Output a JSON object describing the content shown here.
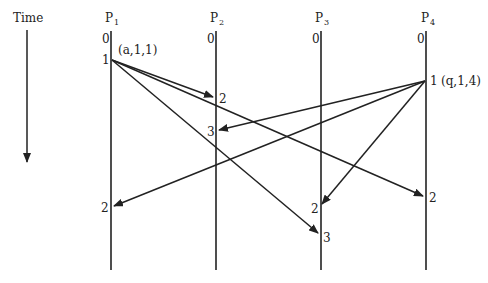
{
  "time_axis": {
    "label": "Time"
  },
  "processes": [
    {
      "name": "P",
      "sub": "1",
      "x": 111,
      "start": "0"
    },
    {
      "name": "P",
      "sub": "2",
      "x": 216,
      "start": "0"
    },
    {
      "name": "P",
      "sub": "3",
      "x": 321,
      "start": "0"
    },
    {
      "name": "P",
      "sub": "4",
      "x": 426,
      "start": "0"
    }
  ],
  "events": [
    {
      "process": "P1",
      "label": "1",
      "annotation": "(a,1,1)"
    },
    {
      "process": "P4",
      "label": "1",
      "annotation": "(q,1,4)"
    },
    {
      "process": "P2",
      "label": "2"
    },
    {
      "process": "P2",
      "label": "3"
    },
    {
      "process": "P1",
      "label": "2"
    },
    {
      "process": "P3",
      "label": "2"
    },
    {
      "process": "P4",
      "label": "2"
    },
    {
      "process": "P3",
      "label": "3"
    }
  ],
  "labels": {
    "p1_e1": "1",
    "p1_e1_ann": "(a,1,1)",
    "p4_e1": "1",
    "p4_e1_ann": "(q,1,4)",
    "p2_e2": "2",
    "p2_e3": "3",
    "p1_e2": "2",
    "p3_e2": "2",
    "p4_e2": "2",
    "p3_e3": "3"
  },
  "messages": [
    {
      "from": "P1:1",
      "to": "P2:2"
    },
    {
      "from": "P1:1",
      "to": "P4:2"
    },
    {
      "from": "P1:1",
      "to": "P3:3"
    },
    {
      "from": "P4:1",
      "to": "P2:3"
    },
    {
      "from": "P4:1",
      "to": "P1:2"
    },
    {
      "from": "P4:1",
      "to": "P3:2"
    }
  ]
}
